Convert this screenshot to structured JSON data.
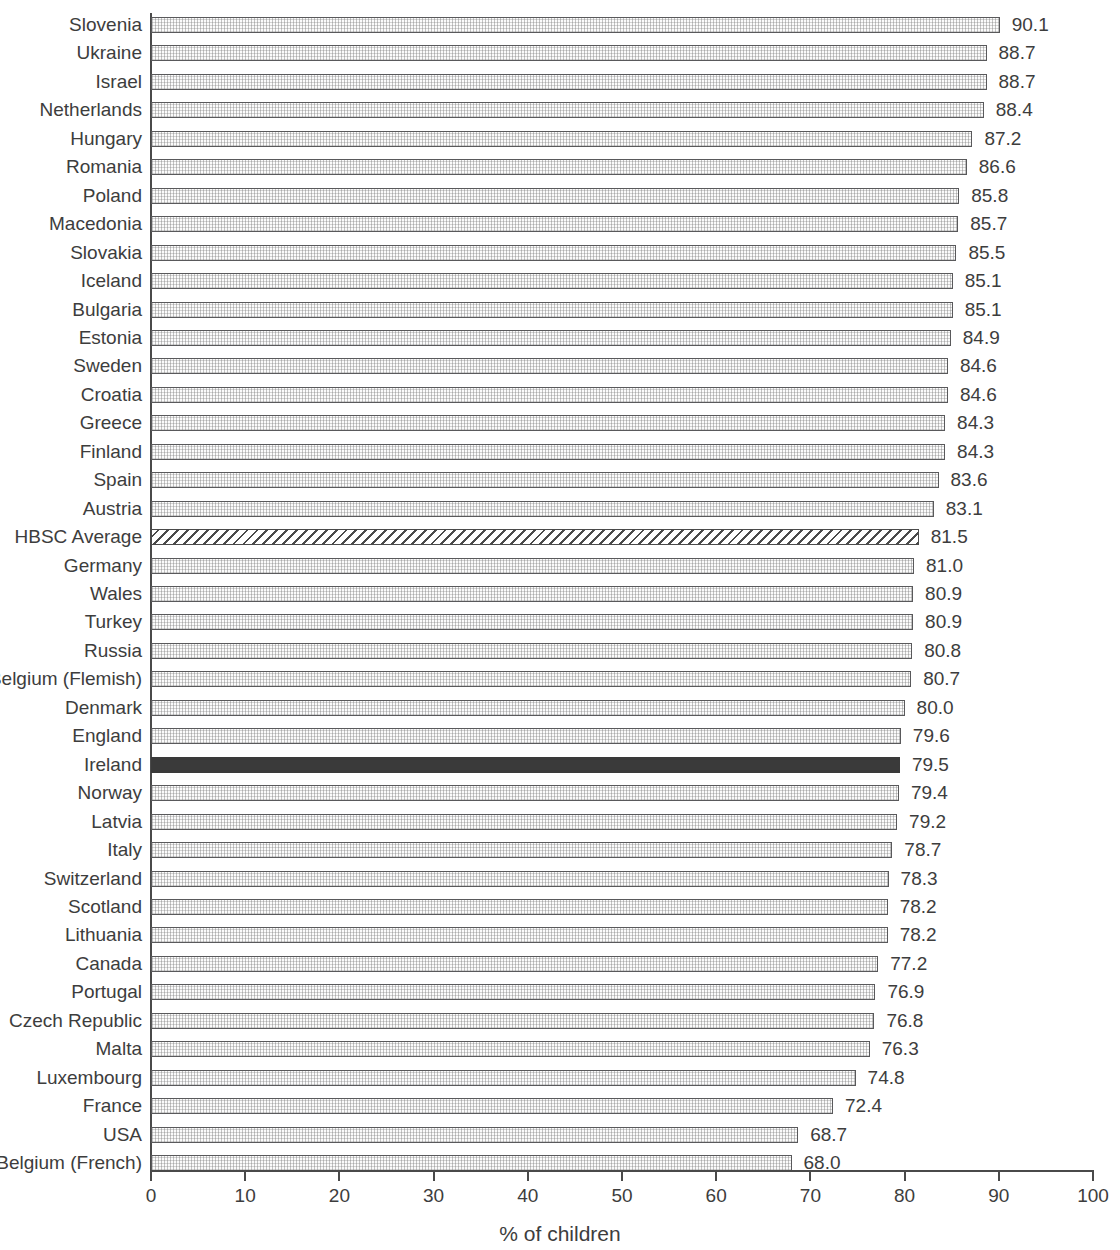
{
  "chart_data": {
    "type": "bar",
    "orientation": "horizontal",
    "title": "",
    "xlabel": "% of children",
    "ylabel": "",
    "xlim": [
      0,
      100
    ],
    "xticks": [
      0,
      10,
      20,
      30,
      40,
      50,
      60,
      70,
      80,
      90,
      100
    ],
    "xtick_labels": [
      "0",
      "10",
      "20",
      "30",
      "40",
      "50",
      "60",
      "70",
      "80",
      "90",
      "100"
    ],
    "grid": false,
    "legend": null,
    "value_label_format": "one-decimal",
    "categories": [
      "Slovenia",
      "Ukraine",
      "Israel",
      "Netherlands",
      "Hungary",
      "Romania",
      "Poland",
      "Macedonia",
      "Slovakia",
      "Iceland",
      "Bulgaria",
      "Estonia",
      "Sweden",
      "Croatia",
      "Greece",
      "Finland",
      "Spain",
      "Austria",
      "HBSC Average",
      "Germany",
      "Wales",
      "Turkey",
      "Russia",
      "Belgium (Flemish)",
      "Denmark",
      "England",
      "Ireland",
      "Norway",
      "Latvia",
      "Italy",
      "Switzerland",
      "Scotland",
      "Lithuania",
      "Canada",
      "Portugal",
      "Czech Republic",
      "Malta",
      "Luxembourg",
      "France",
      "USA",
      "Belgium (French)"
    ],
    "values": [
      90.1,
      88.7,
      88.7,
      88.4,
      87.2,
      86.6,
      85.8,
      85.7,
      85.5,
      85.1,
      85.1,
      84.9,
      84.6,
      84.6,
      84.3,
      84.3,
      83.6,
      83.1,
      81.5,
      81.0,
      80.9,
      80.9,
      80.8,
      80.7,
      80.0,
      79.6,
      79.5,
      79.4,
      79.2,
      78.7,
      78.3,
      78.2,
      78.2,
      77.2,
      76.9,
      76.8,
      76.3,
      74.8,
      72.4,
      68.7,
      68.0
    ],
    "value_labels": [
      "90.1",
      "88.7",
      "88.7",
      "88.4",
      "87.2",
      "86.6",
      "85.8",
      "85.7",
      "85.5",
      "85.1",
      "85.1",
      "84.9",
      "84.6",
      "84.6",
      "84.3",
      "84.3",
      "83.6",
      "83.1",
      "81.5",
      "81.0",
      "80.9",
      "80.9",
      "80.8",
      "80.7",
      "80.0",
      "79.6",
      "79.5",
      "79.4",
      "79.2",
      "78.7",
      "78.3",
      "78.2",
      "78.2",
      "77.2",
      "76.9",
      "76.8",
      "76.3",
      "74.8",
      "72.4",
      "68.7",
      "68.0"
    ],
    "bar_styles": [
      "texture",
      "texture",
      "texture",
      "texture",
      "texture",
      "texture",
      "texture",
      "texture",
      "texture",
      "texture",
      "texture",
      "texture",
      "texture",
      "texture",
      "texture",
      "texture",
      "texture",
      "texture",
      "hatch",
      "texture",
      "texture",
      "texture",
      "texture",
      "texture",
      "texture",
      "texture",
      "solid",
      "texture",
      "texture",
      "texture",
      "texture",
      "texture",
      "texture",
      "texture",
      "texture",
      "texture",
      "texture",
      "texture",
      "texture",
      "texture",
      "texture"
    ],
    "highlight_categories": [
      "HBSC Average",
      "Ireland"
    ],
    "colors": {
      "axis": "#4a4a4a",
      "text": "#3d3d3d",
      "bar_outline": "#59595b",
      "bar_fill": "#fbfbfb",
      "highlight_solid": "#3a3a3a",
      "hatch": "#4a4a4a",
      "background": "#ffffff"
    }
  }
}
